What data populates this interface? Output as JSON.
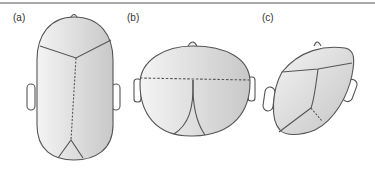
{
  "figure": {
    "panels": [
      {
        "label": "(a)",
        "view": "top view, elongated head"
      },
      {
        "label": "(b)",
        "view": "top view, broad head"
      },
      {
        "label": "(c)",
        "view": "oblique view, skewed head"
      }
    ],
    "colors": {
      "outline": "#555555",
      "fill_light": "#f2f2f2",
      "fill_dark": "#c9c9c9",
      "rule": "#a9a9a9"
    }
  }
}
